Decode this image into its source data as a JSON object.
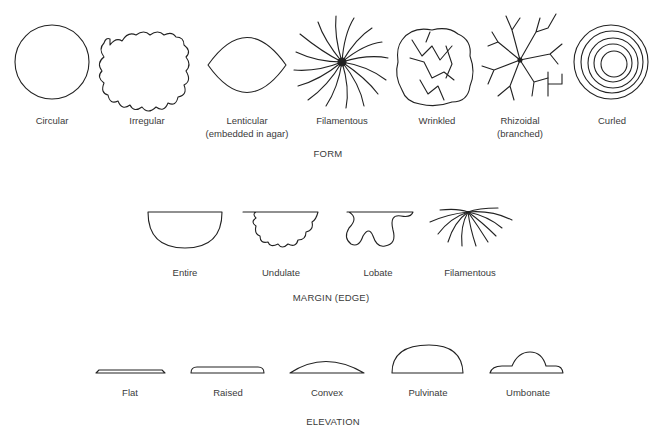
{
  "form": {
    "title": "FORM",
    "items": [
      {
        "label": "Circular",
        "sublabel": ""
      },
      {
        "label": "Irregular",
        "sublabel": ""
      },
      {
        "label": "Lenticular",
        "sublabel": "(embedded in agar)"
      },
      {
        "label": "Filamentous",
        "sublabel": ""
      },
      {
        "label": "Wrinkled",
        "sublabel": ""
      },
      {
        "label": "Rhizoidal",
        "sublabel": "(branched)"
      },
      {
        "label": "Curled",
        "sublabel": ""
      }
    ]
  },
  "margin": {
    "title": "MARGIN (EDGE)",
    "items": [
      {
        "label": "Entire"
      },
      {
        "label": "Undulate"
      },
      {
        "label": "Lobate"
      },
      {
        "label": "Filamentous"
      }
    ]
  },
  "elevation": {
    "title": "ELEVATION",
    "items": [
      {
        "label": "Flat"
      },
      {
        "label": "Raised"
      },
      {
        "label": "Convex"
      },
      {
        "label": "Pulvinate"
      },
      {
        "label": "Umbonate"
      }
    ]
  },
  "colors": {
    "line": "#222222",
    "text": "#3a3a3a",
    "background": "#ffffff"
  }
}
